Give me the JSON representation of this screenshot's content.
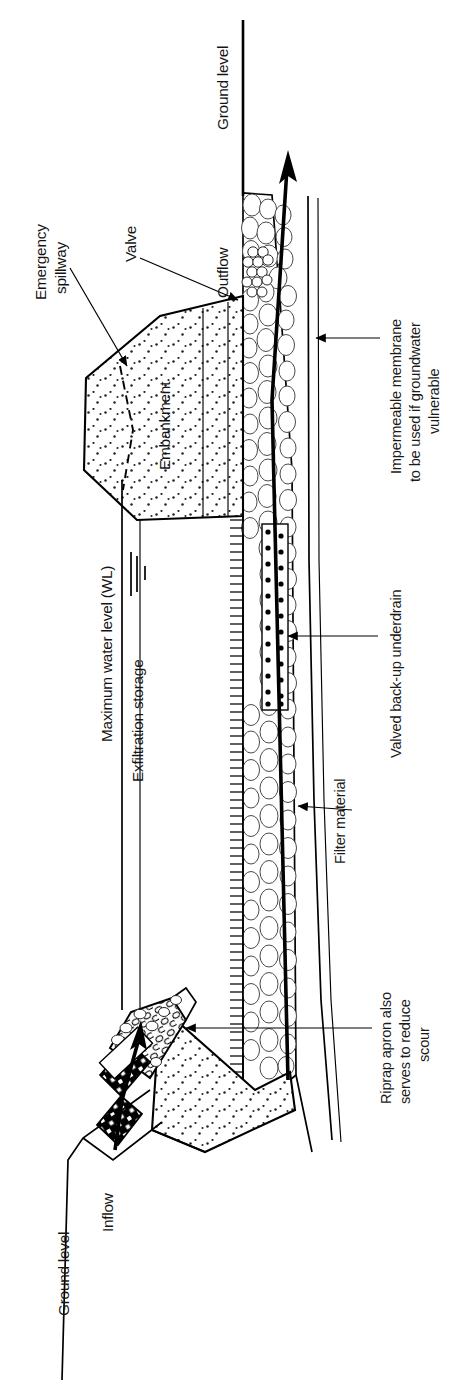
{
  "figure": {
    "orientation": "rotated-90-ccw",
    "width": 470,
    "height": 1393
  },
  "labels": {
    "ground_level_top": "Ground level",
    "ground_level_bottom": "Ground level",
    "emergency_spillway_line1": "Emergency",
    "emergency_spillway_line2": "spillway",
    "valve": "Valve",
    "outflow": "Outflow",
    "embankment": "Embankment",
    "maximum_water_level": "Maximum water level (WL)",
    "exfiltration_storage": "Exfiltration storage",
    "inflow": "Inflow",
    "impermeable_membrane_line1": "Impermeable membrane",
    "impermeable_membrane_line2": "to be used if groundwater",
    "impermeable_membrane_line3": "vulnerable",
    "valved_backup_underdrain": "Valved back-up underdrain",
    "filter_material": "Filter material",
    "riprap_line1": "Riprap apron also",
    "riprap_line2": "serves to reduce",
    "riprap_line3": "scour"
  },
  "colors": {
    "ink": "#000000",
    "background": "#ffffff",
    "stone_outline": "#4a4a4a",
    "text": "#141414"
  },
  "icons": {
    "outflow_arrow": "arrow-up-icon",
    "inflow_arrow": "arrow-up-icon",
    "water_level_marker": "water-level-marker-icon",
    "membrane_leader_arrow": "arrow-left-icon",
    "underdrain_leader_arrow": "arrow-left-icon",
    "filter_leader_arrow": "arrow-left-icon",
    "riprap_leader_arrow": "arrow-left-icon",
    "valve_leader_arrow": "arrow-down-right-icon",
    "spillway_leader_arrow": "arrow-down-right-icon"
  }
}
